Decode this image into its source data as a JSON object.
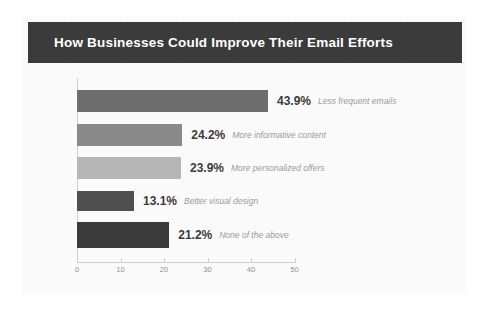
{
  "chart_data": {
    "type": "bar",
    "orientation": "horizontal",
    "title": "How Businesses Could Improve Their Email Efforts",
    "xlabel": "",
    "ylabel": "",
    "xlim": [
      0,
      50
    ],
    "grid": false,
    "legend": "none",
    "categories": [
      "Less frequent emails",
      "More informative content",
      "More personalized offers",
      "Better visual design",
      "None of the above"
    ],
    "values": [
      43.9,
      24.2,
      23.9,
      13.1,
      21.2
    ],
    "value_labels": [
      "43.9%",
      "24.2%",
      "23.9%",
      "13.1%",
      "21.2%"
    ],
    "bar_colors": [
      "#6e6e6e",
      "#8a8a8a",
      "#b6b6b6",
      "#4f4f4f",
      "#3a3a3a"
    ],
    "xticks": [
      0,
      10,
      20,
      30,
      40,
      50
    ],
    "xtick_labels": [
      "0",
      "10",
      "20",
      "30",
      "40",
      "50"
    ]
  },
  "theme": {
    "title_bar_color": "#3b3b3b",
    "title_text_color": "#ffffff",
    "plot_background": "#fafafa",
    "axis_color": "#cfcfcf",
    "value_text_color": "#3a3a3a",
    "category_text_color": "#9a9a9a"
  }
}
